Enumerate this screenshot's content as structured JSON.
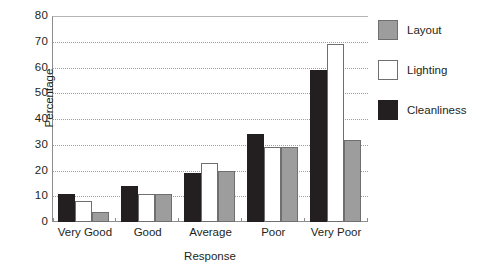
{
  "chart_data": {
    "type": "bar",
    "title": "",
    "xlabel": "Response",
    "ylabel": "Percentage",
    "categories": [
      "Very Good",
      "Good",
      "Average",
      "Poor",
      "Very Poor"
    ],
    "series": [
      {
        "name": "Cleanliness",
        "color": "#231f20",
        "values": [
          11,
          14,
          19,
          34,
          59
        ]
      },
      {
        "name": "Lighting",
        "color": "#ffffff",
        "values": [
          8,
          11,
          23,
          29,
          69
        ]
      },
      {
        "name": "Layout",
        "color": "#9d9d9d",
        "values": [
          4,
          11,
          20,
          29,
          32
        ]
      }
    ],
    "ylim": [
      0,
      80
    ],
    "ytick_values": [
      0,
      10,
      20,
      30,
      40,
      50,
      60,
      70,
      80
    ],
    "ytick_labels": [
      "0",
      "10",
      "20",
      "30",
      "40",
      "50",
      "60",
      "70",
      "80"
    ],
    "grid": true,
    "grid_style": "dotted-horizontal",
    "legend_position": "right",
    "bar_order_in_group": [
      "Cleanliness",
      "Lighting",
      "Layout"
    ]
  },
  "axes": {
    "y_title": "Percentage",
    "x_title": "Response"
  },
  "legend": {
    "entries": [
      {
        "label": "Layout",
        "swatch": "layout"
      },
      {
        "label": "Lighting",
        "swatch": "lighting"
      },
      {
        "label": "Cleanliness",
        "swatch": "cleanliness"
      }
    ]
  },
  "colors": {
    "black": "#231f20",
    "white": "#ffffff",
    "gray": "#9d9d9d",
    "gridline": "#9e9e9e",
    "axis": "#8c8c8c"
  }
}
